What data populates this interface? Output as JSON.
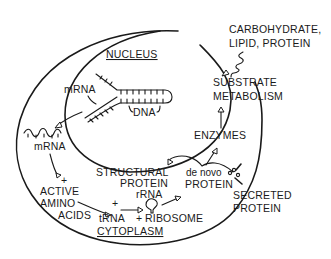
{
  "diagram": {
    "regions": {
      "nucleus": "NUCLEUS",
      "cytoplasm": "CYTOPLASM"
    },
    "labels": {
      "mrna_nucleus": "mRNA",
      "dna": "DNA",
      "mrna_cytoplasm": "mRNA",
      "active_amino_acids": [
        "ACTIVE",
        "AMINO",
        "ACIDS"
      ],
      "trna": "tRNA",
      "rrna": "rRNA",
      "ribosome": "RIBOSOME",
      "structural_protein": [
        "STRUCTURAL",
        "PROTEIN"
      ],
      "de_novo_protein": [
        "de novo",
        "PROTEIN"
      ],
      "enzymes": "ENZYMES",
      "substrate_metabolism": [
        "SUBSTRATE",
        "METABOLISM"
      ],
      "carbohydrate_lipid_protein": [
        "CARBOHYDRATE,",
        "LIPID, PROTEIN"
      ],
      "secreted_protein": [
        "SECRETED",
        "PROTEIN"
      ],
      "plus": "+"
    },
    "flows": [
      {
        "from": "DNA",
        "to": "mRNA (nucleus)"
      },
      {
        "from": "mRNA (nucleus)",
        "to": "mRNA (cytoplasm)"
      },
      {
        "from": "mRNA (cytoplasm)",
        "to": "ACTIVE AMINO ACIDS"
      },
      {
        "from": "ACTIVE AMINO ACIDS",
        "to": "tRNA"
      },
      {
        "from": "tRNA",
        "to": "RIBOSOME"
      },
      {
        "from": "RIBOSOME",
        "to": "de novo PROTEIN"
      },
      {
        "from": "de novo PROTEIN",
        "to": "STRUCTURAL PROTEIN"
      },
      {
        "from": "de novo PROTEIN",
        "to": "ENZYMES"
      },
      {
        "from": "ENZYMES",
        "to": "SUBSTRATE METABOLISM"
      },
      {
        "from": "CARBOHYDRATE, LIPID, PROTEIN",
        "to": "SUBSTRATE METABOLISM"
      },
      {
        "from": "de novo PROTEIN",
        "to": "SECRETED PROTEIN"
      }
    ]
  }
}
